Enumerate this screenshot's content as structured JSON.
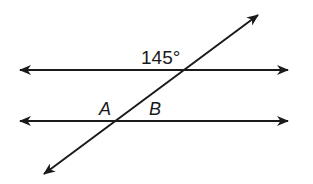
{
  "diagram": {
    "type": "parallel-lines-transversal",
    "angle_label": "145°",
    "point_labels": {
      "A": "A",
      "B": "B"
    },
    "colors": {
      "stroke": "#1a1a1a",
      "background": "#ffffff"
    },
    "lines": {
      "top_parallel": {
        "x1": 19,
        "y1": 70,
        "x2": 289,
        "y2": 70
      },
      "bottom_parallel": {
        "x1": 19,
        "y1": 121,
        "x2": 289,
        "y2": 121
      },
      "transversal": {
        "x1": 43,
        "y1": 175,
        "x2": 259,
        "y2": 14
      }
    },
    "intersections": {
      "top": {
        "x": 182,
        "y": 70
      },
      "bottom": {
        "x": 115,
        "y": 121
      }
    }
  }
}
